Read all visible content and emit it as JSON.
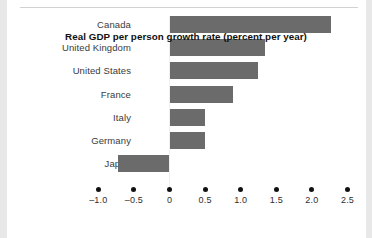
{
  "chart_data": {
    "type": "bar",
    "orientation": "horizontal",
    "title": "",
    "xlabel": "Real GDP per person growth rate (percent per year)",
    "ylabel": "",
    "categories": [
      "Canada",
      "United Kingdom",
      "United States",
      "France",
      "Italy",
      "Germany",
      "Japan"
    ],
    "values": [
      2.27,
      1.34,
      1.24,
      0.89,
      0.5,
      0.5,
      -0.72
    ],
    "xlim": [
      -1.0,
      2.5
    ],
    "xticks": [
      -1.0,
      -0.5,
      0,
      0.5,
      1.0,
      1.5,
      2.0,
      2.5
    ],
    "xticklabels": [
      "–1.0",
      "–0.5",
      "0",
      "0.5",
      "1.0",
      "1.5",
      "2.0",
      "2.5"
    ],
    "grid": false,
    "legend": null,
    "bar_color": "#6b6b6b",
    "tick_marker": "filled-circle",
    "background_color": "#ffffff"
  },
  "figure": {
    "axis_title": "Real GDP per person growth rate (percent per year)"
  }
}
